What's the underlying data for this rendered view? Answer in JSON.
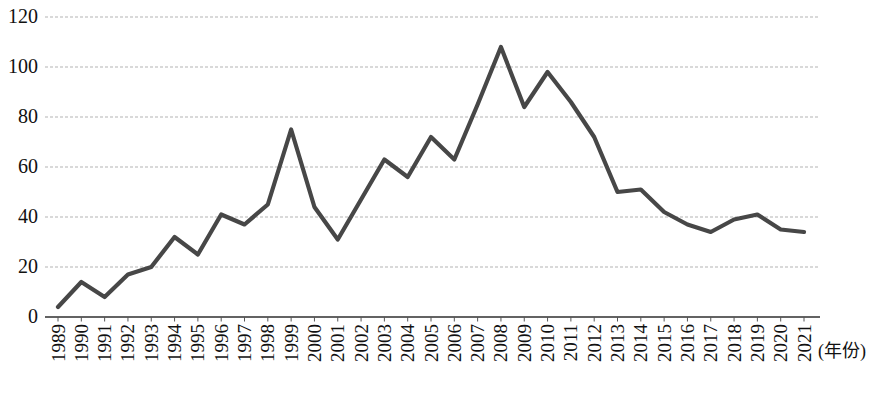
{
  "chart_data": {
    "type": "line",
    "title": "",
    "categories": [
      "1989",
      "1990",
      "1991",
      "1992",
      "1993",
      "1994",
      "1995",
      "1996",
      "1997",
      "1998",
      "1999",
      "2000",
      "2001",
      "2002",
      "2003",
      "2004",
      "2005",
      "2006",
      "2007",
      "2008",
      "2009",
      "2010",
      "2011",
      "2012",
      "2013",
      "2014",
      "2015",
      "2016",
      "2017",
      "2018",
      "2019",
      "2020",
      "2021"
    ],
    "values": [
      4,
      14,
      8,
      17,
      20,
      32,
      25,
      41,
      37,
      45,
      75,
      44,
      31,
      47,
      63,
      56,
      72,
      63,
      85,
      108,
      84,
      98,
      86,
      72,
      50,
      51,
      42,
      37,
      34,
      39,
      41,
      35,
      34
    ],
    "xlabel": "(年份)",
    "ylabel": "",
    "ylim": [
      0,
      120
    ],
    "y_ticks": [
      0,
      20,
      40,
      60,
      80,
      100,
      120
    ],
    "grid": true,
    "gridline_style": "dashed",
    "legend": false,
    "line_color": "#474747",
    "axis_color": "#2f2f2f",
    "gridline_color": "#b3b3b3",
    "tick_color": "#555555",
    "label_color": "#111111",
    "background_color": "#ffffff"
  }
}
